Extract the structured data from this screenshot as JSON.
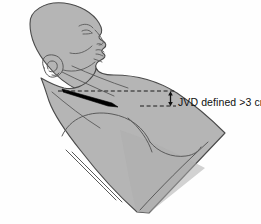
{
  "figure": {
    "background_color": "#fefefe"
  },
  "annotations": {
    "jvd_label": "JVD defined >3 cm",
    "measurement_value": ">3 cm",
    "measurement_unit": "cm",
    "measurement_threshold": 3,
    "arrow_type": "double-headed vertical measurement arrow",
    "reference_line_upper": "dashed horizontal line at top of jugular venous pulsation",
    "reference_line_lower": "dashed horizontal line at sternal angle reference"
  },
  "anatomy": {
    "skin_fill": "#b5b5b5",
    "skin_outline": "#4a4a4a",
    "vein_fill": "#000000",
    "vein_label": "distended jugular vein",
    "features": [
      "head",
      "ear",
      "nose",
      "lips",
      "chin",
      "neck",
      "sternocleidomastoid",
      "clavicle",
      "shoulder",
      "deltoid",
      "chest"
    ]
  },
  "colors": {
    "skin": "#b5b5b5",
    "skin_shadow": "#a5a5a5",
    "outline": "#4a4a4a",
    "vein": "#000000",
    "annotation": "#101010",
    "background": "#fefefe"
  }
}
